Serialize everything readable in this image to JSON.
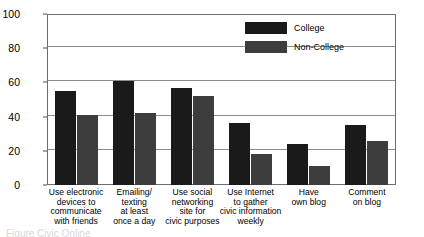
{
  "chart_data": {
    "type": "bar",
    "title": "",
    "xlabel": "",
    "ylabel": "",
    "ylim": [
      0,
      100
    ],
    "yticks": [
      0,
      20,
      40,
      60,
      80,
      100
    ],
    "grid": true,
    "legend_position": "upper right inside plot",
    "categories": [
      "Use electronic\ndevices to\ncommunicate\nwith friends",
      "Emailing/\ntexting\nat least\nonce a day",
      "Use social\nnetworking\nsite for\ncivic purposes",
      "Use Internet\nto gather\ncivic information\nweekly",
      "Have\nown blog",
      "Comment\non blog"
    ],
    "series": [
      {
        "name": "College",
        "color": "#1a1a1a",
        "values": [
          55,
          61,
          57,
          36,
          24,
          35
        ]
      },
      {
        "name": "Non-College",
        "color": "#3d3d3d",
        "values": [
          41,
          42,
          52,
          18,
          11,
          26
        ]
      }
    ]
  },
  "caption": {
    "text": "Figure    Civic Online"
  },
  "colors": {
    "college": "#1a1a1a",
    "noncollege": "#3d3d3d",
    "axis": "#6e6e6e",
    "grid": "#8d8d8d",
    "background": "#ffffff"
  }
}
